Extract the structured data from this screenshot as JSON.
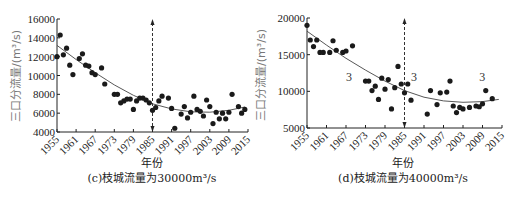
{
  "chart_data": [
    {
      "type": "scatter",
      "panel": "c",
      "title": "(c)枝城流量为30000m³/s",
      "xlabel": "年份",
      "ylabel": "三口分流量/(m³/s)",
      "xlim": [
        1955,
        2015
      ],
      "ylim": [
        4000,
        16000
      ],
      "xticks": [
        "1955",
        "1961",
        "1967",
        "1973",
        "1979",
        "1985",
        "1991",
        "1997",
        "2003",
        "2009",
        "2015"
      ],
      "yticks": [
        "4000",
        "6000",
        "8000",
        "10000",
        "12000",
        "14000",
        "16000"
      ],
      "divider_year": 1985,
      "grid": false,
      "trendline": "polynomial",
      "trend": [
        [
          1955,
          13200
        ],
        [
          1961,
          11700
        ],
        [
          1967,
          10300
        ],
        [
          1973,
          9000
        ],
        [
          1979,
          7900
        ],
        [
          1985,
          7000
        ],
        [
          1991,
          6450
        ],
        [
          1997,
          6150
        ],
        [
          2003,
          6100
        ],
        [
          2009,
          6300
        ],
        [
          2014,
          6650
        ]
      ],
      "points": [
        [
          1955,
          12000
        ],
        [
          1956,
          14300
        ],
        [
          1957,
          12200
        ],
        [
          1958,
          12900
        ],
        [
          1959,
          11100
        ],
        [
          1960,
          10100
        ],
        [
          1962,
          11800
        ],
        [
          1963,
          12300
        ],
        [
          1964,
          11100
        ],
        [
          1965,
          11000
        ],
        [
          1966,
          10300
        ],
        [
          1967,
          10100
        ],
        [
          1969,
          10800
        ],
        [
          1970,
          9100
        ],
        [
          1973,
          8000
        ],
        [
          1974,
          8000
        ],
        [
          1975,
          7100
        ],
        [
          1976,
          7300
        ],
        [
          1977,
          7500
        ],
        [
          1978,
          7500
        ],
        [
          1979,
          6400
        ],
        [
          1980,
          7300
        ],
        [
          1981,
          7600
        ],
        [
          1982,
          7600
        ],
        [
          1983,
          7400
        ],
        [
          1984,
          7100
        ],
        [
          1985,
          6300
        ],
        [
          1986,
          6600
        ],
        [
          1987,
          7300
        ],
        [
          1988,
          7800
        ],
        [
          1990,
          7600
        ],
        [
          1991,
          6500
        ],
        [
          1992,
          4400
        ],
        [
          1994,
          5900
        ],
        [
          1995,
          6700
        ],
        [
          1996,
          5500
        ],
        [
          1997,
          6100
        ],
        [
          1998,
          7800
        ],
        [
          1999,
          6400
        ],
        [
          2000,
          6200
        ],
        [
          2001,
          5700
        ],
        [
          2002,
          7400
        ],
        [
          2003,
          6700
        ],
        [
          2004,
          4900
        ],
        [
          2005,
          6100
        ],
        [
          2006,
          5400
        ],
        [
          2007,
          6000
        ],
        [
          2008,
          5400
        ],
        [
          2009,
          6100
        ],
        [
          2010,
          8000
        ],
        [
          2012,
          6700
        ],
        [
          2013,
          6000
        ],
        [
          2014,
          6400
        ]
      ]
    },
    {
      "type": "scatter",
      "panel": "d",
      "title": "(d)枝城流量为40000m³/s",
      "xlabel": "年份",
      "ylabel": "三口分流量/(m³/s)",
      "xlim": [
        1955,
        2015
      ],
      "ylim": [
        5000,
        20000
      ],
      "xticks": [
        "1955",
        "1961",
        "1967",
        "1973",
        "1979",
        "1985",
        "1991",
        "1997",
        "2003",
        "2009",
        "2015"
      ],
      "yticks": [
        "5000",
        "10000",
        "15000",
        "20000"
      ],
      "divider_year": 1985,
      "grid": false,
      "annotations": [
        {
          "text": "3",
          "x": 1967,
          "y": 12000
        },
        {
          "text": "3",
          "x": 1987,
          "y": 12000
        },
        {
          "text": "3",
          "x": 2008,
          "y": 12000
        }
      ],
      "trendline": "polynomial",
      "trend": [
        [
          1955,
          18200
        ],
        [
          1961,
          16300
        ],
        [
          1967,
          14500
        ],
        [
          1973,
          12900
        ],
        [
          1979,
          11400
        ],
        [
          1985,
          10100
        ],
        [
          1991,
          9200
        ],
        [
          1997,
          8700
        ],
        [
          2003,
          8500
        ],
        [
          2009,
          8600
        ],
        [
          2014,
          8900
        ]
      ],
      "points": [
        [
          1955,
          19000
        ],
        [
          1956,
          17000
        ],
        [
          1957,
          16100
        ],
        [
          1958,
          17000
        ],
        [
          1959,
          15300
        ],
        [
          1960,
          15300
        ],
        [
          1962,
          15300
        ],
        [
          1963,
          16900
        ],
        [
          1964,
          15600
        ],
        [
          1966,
          15300
        ],
        [
          1967,
          15500
        ],
        [
          1969,
          16200
        ],
        [
          1973,
          11400
        ],
        [
          1974,
          11400
        ],
        [
          1975,
          10100
        ],
        [
          1976,
          10700
        ],
        [
          1977,
          8900
        ],
        [
          1978,
          11800
        ],
        [
          1979,
          10300
        ],
        [
          1980,
          11600
        ],
        [
          1981,
          7600
        ],
        [
          1982,
          10500
        ],
        [
          1983,
          13400
        ],
        [
          1984,
          11000
        ],
        [
          1985,
          9800
        ],
        [
          1986,
          11000
        ],
        [
          1987,
          8800
        ],
        [
          1992,
          6900
        ],
        [
          1993,
          10100
        ],
        [
          1995,
          8200
        ],
        [
          1996,
          9800
        ],
        [
          1998,
          9900
        ],
        [
          1999,
          11400
        ],
        [
          2000,
          8000
        ],
        [
          2001,
          7100
        ],
        [
          2002,
          7800
        ],
        [
          2003,
          7600
        ],
        [
          2005,
          7800
        ],
        [
          2007,
          8000
        ],
        [
          2008,
          7900
        ],
        [
          2009,
          8300
        ],
        [
          2010,
          10100
        ],
        [
          2012,
          9000
        ]
      ]
    }
  ],
  "labels": {
    "c": {
      "ylabel": "三口分流量/(m³/s)",
      "xlabel": "年份",
      "caption": "(c)枝城流量为30000m³/s"
    },
    "d": {
      "ylabel": "三口分流量/(m³/s)",
      "xlabel": "年份",
      "caption": "(d)枝城流量为40000m³/s"
    }
  }
}
